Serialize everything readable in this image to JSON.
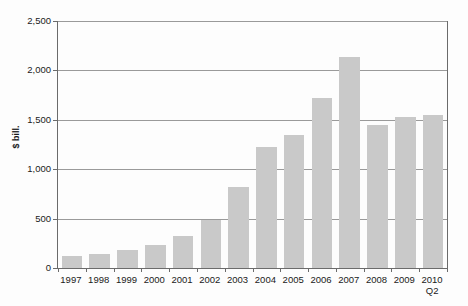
{
  "chart_data": {
    "type": "bar",
    "title": "",
    "subtitle": "",
    "xlabel": "",
    "ylabel": "$ bill.",
    "categories": [
      "1997",
      "1998",
      "1999",
      "2000",
      "2001",
      "2002",
      "2003",
      "2004",
      "2005",
      "2006",
      "2007",
      "2008",
      "2009",
      "2010"
    ],
    "category_sublabels": [
      "",
      "",
      "",
      "",
      "",
      "",
      "",
      "",
      "",
      "",
      "",
      "",
      "",
      "Q2"
    ],
    "values": [
      120,
      145,
      185,
      235,
      320,
      490,
      825,
      1225,
      1350,
      1720,
      2140,
      1450,
      1530,
      1545
    ],
    "ylim": [
      0,
      2500
    ],
    "ytick_values": [
      0,
      500,
      1000,
      1500,
      2000,
      2500
    ],
    "ytick_labels": [
      "0",
      "500",
      "1,000",
      "1,500",
      "2,000",
      "2,500"
    ],
    "grid": true,
    "legend": false,
    "legend_position": "none",
    "series": [
      {
        "name": "",
        "values": [
          120,
          145,
          185,
          235,
          320,
          490,
          825,
          1225,
          1350,
          1720,
          2140,
          1450,
          1530,
          1545
        ]
      }
    ],
    "colors": {
      "bar": "#c9c9c9",
      "gridline": "#9a9a9a",
      "axis": "#6b6b6b",
      "text": "#1a1a1a",
      "background": "#fdfdfd"
    }
  }
}
